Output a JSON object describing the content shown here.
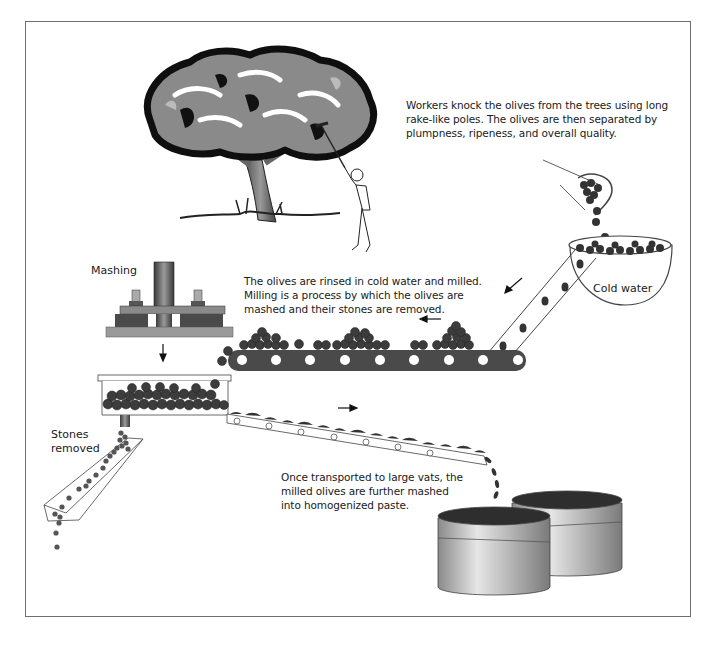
{
  "diagram": {
    "captions": {
      "harvest": "Workers knock the olives from the trees using long rake-like poles. The olives are then separated by plumpness, ripeness, and overall quality.",
      "rinse_mill": "The olives are rinsed in cold water and milled. Milling is a process by which the olives are mashed and their stones are removed.",
      "vats": "Once transported to large vats, the milled olives are further mashed into homogenized paste."
    },
    "labels": {
      "mashing": "Mashing",
      "cold_water": "Cold water",
      "stones_line1": "Stones",
      "stones_line2": "removed"
    },
    "colors": {
      "olive": "#3c3c3c",
      "conveyor": "#4a4a4a",
      "tree_dark": "#111111",
      "tree_mid": "#7d7d7d",
      "vat_top": "#2e2e2e",
      "frame": "#6e6e6e"
    }
  }
}
